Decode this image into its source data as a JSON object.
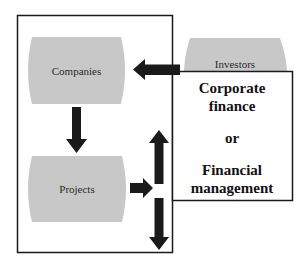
{
  "diagram": {
    "nodes": {
      "companies": {
        "label": "Companies"
      },
      "projects": {
        "label": "Projects"
      },
      "investors": {
        "label": "Investors"
      }
    },
    "finance_box": {
      "lines": [
        "Corporate",
        "finance",
        "or",
        "Financial",
        "management"
      ]
    },
    "edges": [
      {
        "from": "investors",
        "to": "companies",
        "direction": "left"
      },
      {
        "from": "companies",
        "to": "projects",
        "direction": "down"
      },
      {
        "from": "projects",
        "to": "finance-box",
        "direction": "right"
      },
      {
        "from": "finance-box",
        "to": "up",
        "direction": "up"
      },
      {
        "from": "finance-box",
        "to": "down",
        "direction": "down"
      }
    ],
    "colors": {
      "node_fill": "#c8c8c8",
      "arrow": "#1a1a1a",
      "frame": "#1a1a1a",
      "background": "#ffffff"
    }
  }
}
